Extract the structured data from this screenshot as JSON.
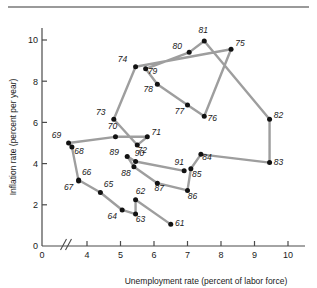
{
  "chart_data": {
    "type": "scatter",
    "title": "",
    "xlabel": "Unemployment rate (percent of labor force)",
    "ylabel": "Inflation rate (percent per year)",
    "xlim": [
      3.2,
      10.6
    ],
    "ylim": [
      0,
      10.9
    ],
    "xticks": [
      0,
      4,
      5,
      6,
      7,
      8,
      9,
      10
    ],
    "yticks": [
      0,
      2,
      4,
      6,
      8,
      10
    ],
    "axis_break": true,
    "axis_break_note": "double slash break on x-axis between 0 and 4",
    "grid": false,
    "legend": "none",
    "connected": true,
    "series_name": "Phillips curve path by year",
    "points": [
      {
        "label": "61",
        "x": 6.5,
        "y": 1.05
      },
      {
        "label": "62",
        "x": 5.45,
        "y": 2.25
      },
      {
        "label": "63",
        "x": 5.45,
        "y": 1.55
      },
      {
        "label": "64",
        "x": 5.05,
        "y": 1.75
      },
      {
        "label": "65",
        "x": 4.4,
        "y": 2.6
      },
      {
        "label": "66",
        "x": 3.75,
        "y": 3.2
      },
      {
        "label": "67",
        "x": 3.75,
        "y": 3.15
      },
      {
        "label": "68",
        "x": 3.55,
        "y": 4.8
      },
      {
        "label": "69",
        "x": 3.45,
        "y": 5.0
      },
      {
        "label": "70",
        "x": 4.85,
        "y": 5.3
      },
      {
        "label": "71",
        "x": 5.8,
        "y": 5.3
      },
      {
        "label": "72",
        "x": 5.5,
        "y": 4.9
      },
      {
        "label": "73",
        "x": 4.8,
        "y": 6.15
      },
      {
        "label": "74",
        "x": 5.45,
        "y": 8.7
      },
      {
        "label": "75",
        "x": 8.3,
        "y": 9.55
      },
      {
        "label": "76",
        "x": 7.5,
        "y": 6.3
      },
      {
        "label": "77",
        "x": 7.0,
        "y": 6.85
      },
      {
        "label": "78",
        "x": 6.1,
        "y": 7.85
      },
      {
        "label": "79",
        "x": 5.75,
        "y": 8.6
      },
      {
        "label": "80",
        "x": 7.05,
        "y": 9.4
      },
      {
        "label": "81",
        "x": 7.5,
        "y": 9.95
      },
      {
        "label": "82",
        "x": 9.45,
        "y": 6.15
      },
      {
        "label": "83",
        "x": 9.45,
        "y": 4.05
      },
      {
        "label": "84",
        "x": 7.4,
        "y": 4.45
      },
      {
        "label": "85",
        "x": 7.1,
        "y": 3.75
      },
      {
        "label": "86",
        "x": 7.0,
        "y": 2.7
      },
      {
        "label": "87",
        "x": 6.1,
        "y": 3.05
      },
      {
        "label": "88",
        "x": 5.4,
        "y": 3.85
      },
      {
        "label": "89",
        "x": 5.2,
        "y": 4.35
      },
      {
        "label": "90",
        "x": 5.45,
        "y": 4.1
      },
      {
        "label": "91",
        "x": 6.9,
        "y": 3.65
      }
    ],
    "label_offsets": {
      "61": [
        9,
        2
      ],
      "62": [
        5,
        -6
      ],
      "63": [
        5,
        8
      ],
      "64": [
        -10,
        9
      ],
      "65": [
        8,
        -5
      ],
      "66": [
        8,
        -5
      ],
      "67": [
        -10,
        9
      ],
      "68": [
        7,
        7
      ],
      "69": [
        -12,
        -5
      ],
      "70": [
        -3,
        -8
      ],
      "71": [
        9,
        -2
      ],
      "72": [
        5,
        8
      ],
      "73": [
        -13,
        -4
      ],
      "74": [
        -13,
        -5
      ],
      "75": [
        9,
        -3
      ],
      "76": [
        8,
        5
      ],
      "77": [
        -8,
        9
      ],
      "78": [
        -9,
        8
      ],
      "79": [
        7,
        5
      ],
      "80": [
        -12,
        -3
      ],
      "81": [
        -1,
        -8
      ],
      "82": [
        9,
        -1
      ],
      "83": [
        9,
        2
      ],
      "84": [
        6,
        6
      ],
      "85": [
        6,
        8
      ],
      "86": [
        5,
        9
      ],
      "87": [
        2,
        8
      ],
      "88": [
        -8,
        9
      ],
      "89": [
        -13,
        -1
      ],
      "90": [
        4,
        -6
      ],
      "91": [
        -5,
        -6
      ]
    },
    "series_order": [
      "61",
      "62",
      "63",
      "64",
      "65",
      "66",
      "67",
      "68",
      "69",
      "70",
      "71",
      "72",
      "73",
      "74",
      "75",
      "76",
      "77",
      "78",
      "79",
      "80",
      "81",
      "82",
      "83",
      "84",
      "85",
      "86",
      "87",
      "88",
      "89",
      "90",
      "91"
    ],
    "colors": {
      "line": "#9e9e9e",
      "marker": "#121212",
      "axis": "#4a4a4a",
      "text": "#1a1a1a",
      "rule": "#9a9a9a"
    }
  },
  "axis": {
    "x_title": "Unemployment rate (percent of labor force)",
    "y_title": "Inflation rate (percent per year)",
    "x_tick_labels": [
      "0",
      "4",
      "5",
      "6",
      "7",
      "8",
      "9",
      "10"
    ],
    "y_tick_labels": [
      "0",
      "2",
      "4",
      "6",
      "8",
      "10"
    ]
  }
}
